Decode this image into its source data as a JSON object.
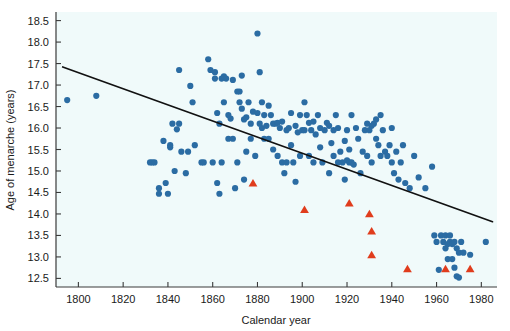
{
  "chart_data": {
    "type": "scatter",
    "title": "",
    "xlabel": "Calendar year",
    "ylabel": "Age of menarche (years)",
    "xlim": [
      1790,
      1987
    ],
    "ylim": [
      12.3,
      18.7
    ],
    "xticks": [
      1800,
      1820,
      1840,
      1860,
      1880,
      1900,
      1920,
      1940,
      1960,
      1980
    ],
    "yticks": [
      12.5,
      13.0,
      13.5,
      14.0,
      14.5,
      15.0,
      15.5,
      16.0,
      16.5,
      17.0,
      17.5,
      18.0,
      18.5
    ],
    "ytick_labels": [
      "12.5",
      "13.0",
      "13.5",
      "14.0",
      "14.5",
      "15.0",
      "15.5",
      "16.0",
      "16.5",
      "17.0",
      "17.5",
      "18.0",
      "18.5"
    ],
    "xtick_labels": [
      "1800",
      "1820",
      "1840",
      "1860",
      "1880",
      "1900",
      "1920",
      "1940",
      "1960",
      "1980"
    ],
    "grid": false,
    "plot_bg": "#f0fafa",
    "legend": null,
    "series": [
      {
        "name": "Historical records (circles)",
        "marker": "circle",
        "color": "#2b6ca3",
        "points": [
          [
            1795,
            16.65
          ],
          [
            1808,
            16.75
          ],
          [
            1832,
            15.2
          ],
          [
            1833,
            15.2
          ],
          [
            1834,
            15.2
          ],
          [
            1836,
            14.6
          ],
          [
            1836,
            14.47
          ],
          [
            1838,
            15.7
          ],
          [
            1839,
            14.72
          ],
          [
            1840,
            14.47
          ],
          [
            1841,
            15.6
          ],
          [
            1841,
            15.55
          ],
          [
            1842,
            16.1
          ],
          [
            1843,
            15.0
          ],
          [
            1844,
            15.97
          ],
          [
            1845,
            17.35
          ],
          [
            1845,
            16.1
          ],
          [
            1846,
            15.45
          ],
          [
            1848,
            14.95
          ],
          [
            1849,
            15.45
          ],
          [
            1850,
            16.98
          ],
          [
            1851,
            16.6
          ],
          [
            1852,
            15.6
          ],
          [
            1855,
            15.2
          ],
          [
            1856,
            15.2
          ],
          [
            1858,
            17.6
          ],
          [
            1859,
            17.35
          ],
          [
            1860,
            15.2
          ],
          [
            1861,
            17.15
          ],
          [
            1861,
            17.3
          ],
          [
            1862,
            14.72
          ],
          [
            1862,
            16.35
          ],
          [
            1863,
            16.1
          ],
          [
            1863,
            14.47
          ],
          [
            1864,
            15.2
          ],
          [
            1864,
            17.15
          ],
          [
            1865,
            17.2
          ],
          [
            1865,
            16.6
          ],
          [
            1866,
            17.15
          ],
          [
            1867,
            16.3
          ],
          [
            1867,
            15.75
          ],
          [
            1868,
            16.22
          ],
          [
            1869,
            17.12
          ],
          [
            1869,
            15.75
          ],
          [
            1870,
            14.6
          ],
          [
            1871,
            16.85
          ],
          [
            1871,
            15.2
          ],
          [
            1872,
            16.85
          ],
          [
            1872,
            16.6
          ],
          [
            1873,
            17.22
          ],
          [
            1873,
            16.45
          ],
          [
            1874,
            16.2
          ],
          [
            1874,
            14.8
          ],
          [
            1875,
            16.25
          ],
          [
            1875,
            15.45
          ],
          [
            1876,
            16.6
          ],
          [
            1877,
            16.1
          ],
          [
            1877,
            15.75
          ],
          [
            1878,
            16.38
          ],
          [
            1879,
            15.35
          ],
          [
            1880,
            18.2
          ],
          [
            1880,
            16.35
          ],
          [
            1881,
            17.3
          ],
          [
            1881,
            16.1
          ],
          [
            1882,
            16.6
          ],
          [
            1882,
            16.0
          ],
          [
            1883,
            16.3
          ],
          [
            1883,
            15.75
          ],
          [
            1884,
            16.05
          ],
          [
            1885,
            15.75
          ],
          [
            1885,
            16.52
          ],
          [
            1886,
            16.3
          ],
          [
            1887,
            16.1
          ],
          [
            1887,
            15.5
          ],
          [
            1888,
            16.1
          ],
          [
            1889,
            16.12
          ],
          [
            1889,
            15.35
          ],
          [
            1890,
            16.0
          ],
          [
            1891,
            16.15
          ],
          [
            1891,
            15.2
          ],
          [
            1892,
            14.95
          ],
          [
            1893,
            15.95
          ],
          [
            1893,
            15.2
          ],
          [
            1894,
            16.0
          ],
          [
            1895,
            16.35
          ],
          [
            1895,
            15.6
          ],
          [
            1896,
            15.2
          ],
          [
            1897,
            16.05
          ],
          [
            1897,
            14.75
          ],
          [
            1898,
            15.9
          ],
          [
            1899,
            16.3
          ],
          [
            1899,
            15.35
          ],
          [
            1900,
            15.95
          ],
          [
            1901,
            16.6
          ],
          [
            1901,
            15.95
          ],
          [
            1902,
            16.3
          ],
          [
            1903,
            15.35
          ],
          [
            1903,
            16.12
          ],
          [
            1904,
            15.95
          ],
          [
            1905,
            16.15
          ],
          [
            1905,
            15.2
          ],
          [
            1906,
            15.85
          ],
          [
            1907,
            16.3
          ],
          [
            1908,
            15.55
          ],
          [
            1908,
            16.0
          ],
          [
            1909,
            15.2
          ],
          [
            1910,
            15.95
          ],
          [
            1911,
            16.12
          ],
          [
            1912,
            16.05
          ],
          [
            1912,
            14.95
          ],
          [
            1913,
            15.65
          ],
          [
            1914,
            15.95
          ],
          [
            1914,
            15.35
          ],
          [
            1915,
            16.3
          ],
          [
            1916,
            16.0
          ],
          [
            1916,
            15.2
          ],
          [
            1917,
            15.45
          ],
          [
            1918,
            15.2
          ],
          [
            1919,
            15.7
          ],
          [
            1919,
            14.8
          ],
          [
            1920,
            15.95
          ],
          [
            1920,
            15.25
          ],
          [
            1921,
            15.5
          ],
          [
            1921,
            15.2
          ],
          [
            1922,
            16.3
          ],
          [
            1922,
            15.2
          ],
          [
            1923,
            15.15
          ],
          [
            1924,
            16.0
          ],
          [
            1925,
            15.75
          ],
          [
            1926,
            14.95
          ],
          [
            1927,
            15.45
          ],
          [
            1928,
            15.95
          ],
          [
            1929,
            16.1
          ],
          [
            1929,
            15.35
          ],
          [
            1930,
            15.95
          ],
          [
            1931,
            16.05
          ],
          [
            1931,
            15.2
          ],
          [
            1932,
            16.1
          ],
          [
            1933,
            15.75
          ],
          [
            1933,
            16.2
          ],
          [
            1934,
            15.6
          ],
          [
            1935,
            16.3
          ],
          [
            1935,
            15.35
          ],
          [
            1936,
            15.95
          ],
          [
            1937,
            15.45
          ],
          [
            1938,
            15.35
          ],
          [
            1939,
            15.6
          ],
          [
            1940,
            16.0
          ],
          [
            1940,
            15.2
          ],
          [
            1941,
            14.95
          ],
          [
            1942,
            15.45
          ],
          [
            1943,
            14.8
          ],
          [
            1944,
            15.2
          ],
          [
            1945,
            15.6
          ],
          [
            1946,
            14.72
          ],
          [
            1948,
            14.6
          ],
          [
            1950,
            15.35
          ],
          [
            1952,
            14.85
          ],
          [
            1955,
            14.6
          ],
          [
            1958,
            15.1
          ],
          [
            1959,
            13.5
          ],
          [
            1960,
            13.35
          ],
          [
            1961,
            12.7
          ],
          [
            1962,
            13.5
          ],
          [
            1963,
            13.35
          ],
          [
            1964,
            13.5
          ],
          [
            1964,
            13.2
          ],
          [
            1965,
            13.3
          ],
          [
            1965,
            12.95
          ],
          [
            1966,
            13.5
          ],
          [
            1966,
            13.35
          ],
          [
            1967,
            13.3
          ],
          [
            1967,
            12.95
          ],
          [
            1968,
            13.35
          ],
          [
            1968,
            12.75
          ],
          [
            1969,
            13.2
          ],
          [
            1969,
            12.55
          ],
          [
            1970,
            13.1
          ],
          [
            1970,
            12.52
          ],
          [
            1971,
            13.35
          ],
          [
            1972,
            13.1
          ],
          [
            1975,
            13.05
          ],
          [
            1982,
            13.35
          ]
        ]
      },
      {
        "name": "Modern surveys (triangles)",
        "marker": "triangle",
        "color": "#e03c1c",
        "points": [
          [
            1878,
            14.72
          ],
          [
            1901,
            14.1
          ],
          [
            1921,
            14.25
          ],
          [
            1930,
            14.0
          ],
          [
            1931,
            13.6
          ],
          [
            1931,
            13.05
          ],
          [
            1947,
            12.72
          ],
          [
            1964,
            12.72
          ],
          [
            1975,
            12.72
          ]
        ]
      }
    ],
    "trendline": {
      "name": "linear-fit",
      "color": "#111111",
      "x0": 1793,
      "y0": 17.42,
      "x1": 1985,
      "y1": 13.82
    }
  }
}
